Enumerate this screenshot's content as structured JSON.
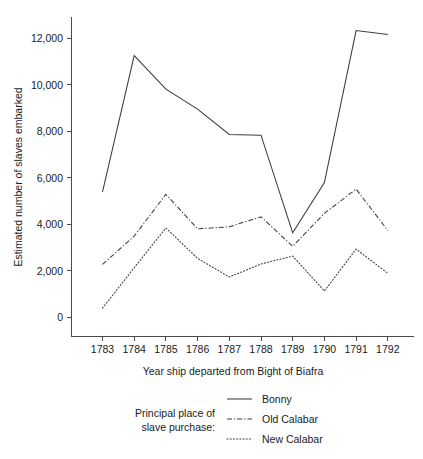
{
  "chart_data": {
    "type": "line",
    "title": "",
    "xlabel": "Year ship departed from Bight of Biafra",
    "ylabel": "Estimated number of slaves embarked",
    "categories": [
      "1783",
      "1784",
      "1785",
      "1786",
      "1787",
      "1788",
      "1789",
      "1790",
      "1791",
      "1792"
    ],
    "x": [
      1783,
      1784,
      1785,
      1786,
      1787,
      1788,
      1789,
      1790,
      1791,
      1792
    ],
    "ylim": [
      0,
      12600
    ],
    "xlim": [
      1782.7,
      1792.3
    ],
    "yticks": [
      0,
      2000,
      4000,
      6000,
      8000,
      10000,
      12000
    ],
    "ytick_labels": [
      "0",
      "2,000",
      "4,000",
      "6,000",
      "8,000",
      "10,000",
      "12,000"
    ],
    "grid": false,
    "legend_position": "below-plot",
    "legend_caption_lines": [
      "Principal place of",
      "slave purchase:"
    ],
    "series": [
      {
        "name": "Bonny",
        "style": "solid",
        "values": [
          5380,
          11240,
          9800,
          8940,
          7850,
          7820,
          3620,
          5780,
          12320,
          12150
        ]
      },
      {
        "name": "Old Calabar",
        "style": "dash-dot",
        "values": [
          2260,
          3480,
          5280,
          3790,
          3880,
          4310,
          3040,
          4460,
          5500,
          3720
        ]
      },
      {
        "name": "New Calabar",
        "style": "dotted",
        "values": [
          380,
          2120,
          3830,
          2520,
          1720,
          2280,
          2620,
          1120,
          2920,
          1880
        ]
      }
    ]
  },
  "axes": {
    "y_title": "Estimated number of slaves embarked",
    "x_title": "Year ship departed from Bight of Biafra"
  },
  "legend": {
    "caption_line1": "Principal place of",
    "caption_line2": "slave purchase:",
    "items": [
      {
        "label": "Bonny",
        "style": "solid"
      },
      {
        "label": "Old Calabar",
        "style": "dash-dot"
      },
      {
        "label": "New Calabar",
        "style": "dotted"
      }
    ]
  }
}
